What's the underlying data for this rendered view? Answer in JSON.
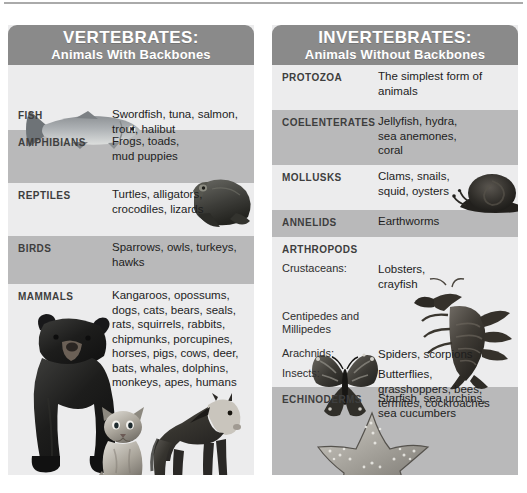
{
  "panels": [
    {
      "id": "vertebrates",
      "header_line1": "VERTEBRATES:",
      "header_line2": "Animals With Backbones",
      "rows": [
        {
          "category": "FISH",
          "description": "Swordfish, tuna, salmon,\ntrout, halibut"
        },
        {
          "category": "AMPHIBIANS",
          "description": "Frogs, toads,\nmud puppies"
        },
        {
          "category": "REPTILES",
          "description": "Turtles, alligators,\ncrocodiles, lizards"
        },
        {
          "category": "BIRDS",
          "description": "Sparrows, owls, turkeys,\nhawks"
        },
        {
          "category": "MAMMALS",
          "description": "Kangaroos, opossums,\ndogs, cats, bears, seals,\nrats, squirrels, rabbits,\nchipmunks, porcupines,\nhorses, pigs, cows, deer,\nbats, whales, dolphins,\nmonkeys, apes, humans"
        }
      ],
      "illustrations": [
        "trout-illustration",
        "frog-illustration",
        "bear-illustration",
        "kitten-illustration",
        "horse-illustration"
      ]
    },
    {
      "id": "invertebrates",
      "header_line1": "INVERTEBRATES:",
      "header_line2": "Animals Without Backbones",
      "rows": [
        {
          "category": "PROTOZOA",
          "description": "The simplest form of\nanimals"
        },
        {
          "category": "COELENTERATES",
          "description": "Jellyfish, hydra,\nsea anemones,\ncoral"
        },
        {
          "category": "MOLLUSKS",
          "description": "Clams, snails,\nsquid, oysters"
        },
        {
          "category": "ANNELIDS",
          "description": "Earthworms"
        },
        {
          "category": "ARTHROPODS",
          "description": ""
        },
        {
          "category": "Crustaceans:",
          "description": "Lobsters,\ncrayfish"
        },
        {
          "category": "Centipedes and\nMillipedes",
          "description": ""
        },
        {
          "category": "Arachnids:",
          "description": "Spiders, scorpions"
        },
        {
          "category": "Insects:",
          "description": "Butterflies,\ngrasshoppers, bees,\ntermites, cockroaches"
        },
        {
          "category": "ECHINODERMS",
          "description": "Starfish, sea urchins,\nsea cucumbers"
        }
      ],
      "illustrations": [
        "snail-illustration",
        "lobster-illustration",
        "butterfly-illustration",
        "starfish-illustration"
      ]
    }
  ],
  "colors": {
    "page_background": "#ffffff",
    "header_gray": "#8a8a8a",
    "band_light": "#ececed",
    "band_dark": "#b9b9ba",
    "category_text": "#3e3e3e",
    "description_text": "#1d1d1d",
    "header_text": "#ffffff"
  }
}
